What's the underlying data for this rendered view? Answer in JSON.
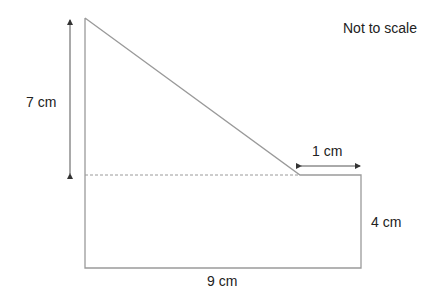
{
  "note": "Not to scale",
  "labels": {
    "height_total": "7 cm",
    "top_right_width": "1 cm",
    "rect_height": "4 cm",
    "base_width": "9 cm"
  },
  "colors": {
    "outline": "#9a9a9a",
    "arrow": "#333333",
    "text": "#222222",
    "background": "#ffffff"
  }
}
